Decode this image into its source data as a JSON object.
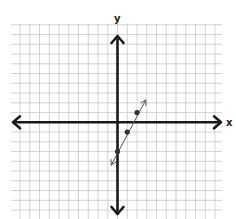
{
  "chart_data": {
    "type": "line",
    "title": "",
    "xlabel": "x",
    "ylabel": "y",
    "grid": true,
    "xlim": [
      -11,
      11
    ],
    "ylim": [
      -10,
      10
    ],
    "tick_labels": [],
    "equation": "y = 2x - 3",
    "slope": 2,
    "y_intercept": -3,
    "series": [
      {
        "name": "line",
        "points": [
          {
            "x": 0,
            "y": -3
          },
          {
            "x": 1,
            "y": -1
          },
          {
            "x": 2,
            "y": 1
          }
        ],
        "arrow_endpoints": [
          {
            "x": -0.65,
            "y": -4.4
          },
          {
            "x": 2.9,
            "y": 2.3
          }
        ]
      }
    ]
  },
  "colors": {
    "grid": "#c8c8c8",
    "axis": "#1a1a1a",
    "line": "#555555",
    "point": "#333333",
    "background": "#ffffff"
  }
}
